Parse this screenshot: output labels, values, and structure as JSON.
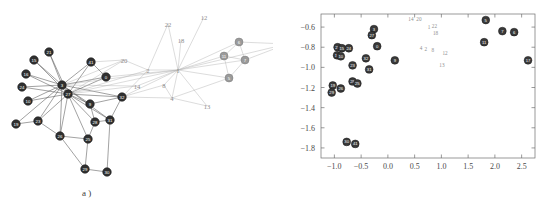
{
  "figure": {
    "panels": [
      {
        "id": "a",
        "caption": "a )"
      },
      {
        "id": "b",
        "caption": "b )"
      }
    ]
  },
  "chart_data": [
    {
      "type": "scatter",
      "panel": "a",
      "title": "",
      "xlabel": "",
      "ylabel": "",
      "grid": false,
      "legend": "none",
      "description": "Force-directed network graph of 22 labelled nodes with straight-line edges. Dark filled nodes form a dense left-hand cluster around two overlapping hubs; light grey numeric labels mark peripheral nodes.",
      "nodes": [
        {
          "id": "21",
          "x": 49,
          "y": 52,
          "kind": "dark"
        },
        {
          "id": "15",
          "x": 34,
          "y": 60,
          "kind": "dark"
        },
        {
          "id": "16",
          "x": 26,
          "y": 74,
          "kind": "dark"
        },
        {
          "id": "24",
          "x": 22,
          "y": 87,
          "kind": "dark"
        },
        {
          "id": "10",
          "x": 28,
          "y": 101,
          "kind": "dark"
        },
        {
          "id": "19",
          "x": 16,
          "y": 124,
          "kind": "dark"
        },
        {
          "id": "23",
          "x": 38,
          "y": 121,
          "kind": "dark"
        },
        {
          "id": "3",
          "x": 62,
          "y": 85,
          "kind": "dark"
        },
        {
          "id": "27",
          "x": 68,
          "y": 94,
          "kind": "dark"
        },
        {
          "id": "26",
          "x": 60,
          "y": 136,
          "kind": "dark"
        },
        {
          "id": "25",
          "x": 88,
          "y": 139,
          "kind": "dark"
        },
        {
          "id": "28",
          "x": 95,
          "y": 122,
          "kind": "dark"
        },
        {
          "id": "9",
          "x": 90,
          "y": 104,
          "kind": "dark"
        },
        {
          "id": "29",
          "x": 85,
          "y": 169,
          "kind": "dark"
        },
        {
          "id": "30",
          "x": 107,
          "y": 172,
          "kind": "dark"
        },
        {
          "id": "31",
          "x": 110,
          "y": 120,
          "kind": "dark"
        },
        {
          "id": "32",
          "x": 122,
          "y": 97,
          "kind": "dark"
        },
        {
          "id": "0",
          "x": 106,
          "y": 77,
          "kind": "dark"
        },
        {
          "id": "41",
          "x": 91,
          "y": 62,
          "kind": "dark"
        },
        {
          "id": "6",
          "x": 239,
          "y": 42,
          "kind": "grey"
        },
        {
          "id": "11",
          "x": 224,
          "y": 56,
          "kind": "grey"
        },
        {
          "id": "7",
          "x": 245,
          "y": 60,
          "kind": "grey"
        },
        {
          "id": "5",
          "x": 229,
          "y": 78,
          "kind": "grey"
        }
      ],
      "free_labels": [
        {
          "text": "22",
          "x": 168,
          "y": 24
        },
        {
          "text": "12",
          "x": 204,
          "y": 17
        },
        {
          "text": "18",
          "x": 181,
          "y": 40
        },
        {
          "text": "20",
          "x": 124,
          "y": 60
        },
        {
          "text": "2",
          "x": 148,
          "y": 70
        },
        {
          "text": "1",
          "x": 178,
          "y": 70
        },
        {
          "text": "14",
          "x": 137,
          "y": 86
        },
        {
          "text": "8",
          "x": 164,
          "y": 85
        },
        {
          "text": "4",
          "x": 172,
          "y": 98
        },
        {
          "text": "13",
          "x": 207,
          "y": 106
        },
        {
          "text": "17",
          "x": 287,
          "y": 44
        }
      ],
      "edges": [
        [
          "3",
          "21"
        ],
        [
          "3",
          "15"
        ],
        [
          "3",
          "16"
        ],
        [
          "3",
          "24"
        ],
        [
          "3",
          "10"
        ],
        [
          "3",
          "23"
        ],
        [
          "3",
          "19"
        ],
        [
          "3",
          "27"
        ],
        [
          "3",
          "0"
        ],
        [
          "3",
          "41"
        ],
        [
          "3",
          "9"
        ],
        [
          "3",
          "31"
        ],
        [
          "3",
          "32"
        ],
        [
          "3",
          "26"
        ],
        [
          "27",
          "21"
        ],
        [
          "27",
          "15"
        ],
        [
          "27",
          "16"
        ],
        [
          "27",
          "24"
        ],
        [
          "27",
          "10"
        ],
        [
          "27",
          "23"
        ],
        [
          "27",
          "0"
        ],
        [
          "27",
          "41"
        ],
        [
          "27",
          "9"
        ],
        [
          "27",
          "28"
        ],
        [
          "27",
          "25"
        ],
        [
          "27",
          "31"
        ],
        [
          "27",
          "32"
        ],
        [
          "27",
          "26"
        ],
        [
          "27",
          "L20"
        ],
        [
          "27",
          "L2"
        ],
        [
          "27",
          "L1"
        ],
        [
          "27",
          "L14"
        ],
        [
          "3",
          "L1"
        ],
        [
          "3",
          "L14"
        ],
        [
          "3",
          "L20"
        ],
        [
          "19",
          "23"
        ],
        [
          "23",
          "26"
        ],
        [
          "26",
          "25"
        ],
        [
          "26",
          "29"
        ],
        [
          "25",
          "28"
        ],
        [
          "25",
          "29"
        ],
        [
          "28",
          "9"
        ],
        [
          "28",
          "31"
        ],
        [
          "9",
          "32"
        ],
        [
          "31",
          "30"
        ],
        [
          "31",
          "32"
        ],
        [
          "29",
          "30"
        ],
        [
          "41",
          "0"
        ],
        [
          "41",
          "L20"
        ],
        [
          "0",
          "L1"
        ],
        [
          "32",
          "L8"
        ],
        [
          "32",
          "L4"
        ],
        [
          "32",
          "L1"
        ],
        [
          "L20",
          "L2"
        ],
        [
          "L2",
          "L1"
        ],
        [
          "L2",
          "L22"
        ],
        [
          "L22",
          "L1"
        ],
        [
          "L18",
          "L1"
        ],
        [
          "L12",
          "L1"
        ],
        [
          "L1",
          "L8"
        ],
        [
          "L1",
          "L4"
        ],
        [
          "L1",
          "L13"
        ],
        [
          "L1",
          "6"
        ],
        [
          "L1",
          "11"
        ],
        [
          "L1",
          "7"
        ],
        [
          "L1",
          "5"
        ],
        [
          "L1",
          "17"
        ],
        [
          "L4",
          "L13"
        ],
        [
          "L4",
          "5"
        ],
        [
          "L8",
          "L4"
        ],
        [
          "6",
          "11"
        ],
        [
          "6",
          "7"
        ],
        [
          "11",
          "7"
        ],
        [
          "11",
          "5"
        ],
        [
          "7",
          "5"
        ],
        [
          "6",
          "17"
        ],
        [
          "7",
          "17"
        ],
        [
          "L14",
          "L1"
        ],
        [
          "L2",
          "32"
        ]
      ]
    },
    {
      "type": "scatter",
      "panel": "b",
      "title": "",
      "xlabel": "",
      "ylabel": "",
      "grid": false,
      "legend": "none",
      "xlim": [
        -1.25,
        2.75
      ],
      "ylim": [
        -1.9,
        -0.47
      ],
      "xticks": [
        "-1.0",
        "-0.5",
        "0.0",
        "0.5",
        "1.0",
        "1.5",
        "2.0",
        "2.5"
      ],
      "xtickvals": [
        -1.0,
        -0.5,
        0.0,
        0.5,
        1.0,
        1.5,
        2.0,
        2.5
      ],
      "yticks": [
        "-0.6",
        "-0.8",
        "-1.0",
        "-1.2",
        "-1.4",
        "-1.6",
        "-1.8"
      ],
      "ytickvals": [
        -0.6,
        -0.8,
        -1.0,
        -1.2,
        -1.4,
        -1.6,
        -1.8
      ],
      "points": [
        {
          "id": "3",
          "x": -0.26,
          "y": -0.62,
          "kind": "dark"
        },
        {
          "id": "27",
          "x": -0.3,
          "y": -0.68,
          "kind": "dark"
        },
        {
          "id": "0",
          "x": -0.2,
          "y": -0.79,
          "kind": "dark"
        },
        {
          "id": "21",
          "x": -0.94,
          "y": -0.8,
          "kind": "dark"
        },
        {
          "id": "15",
          "x": -0.86,
          "y": -0.81,
          "kind": "dark"
        },
        {
          "id": "24",
          "x": -0.73,
          "y": -0.81,
          "kind": "dark"
        },
        {
          "id": "16",
          "x": -0.95,
          "y": -0.88,
          "kind": "dark"
        },
        {
          "id": "10",
          "x": -0.88,
          "y": -0.89,
          "kind": "dark"
        },
        {
          "id": "32",
          "x": -0.41,
          "y": -0.91,
          "kind": "dark"
        },
        {
          "id": "9",
          "x": 0.13,
          "y": -0.93,
          "kind": "dark"
        },
        {
          "id": "23",
          "x": -0.66,
          "y": -0.98,
          "kind": "dark"
        },
        {
          "id": "31",
          "x": -0.35,
          "y": -1.02,
          "kind": "dark"
        },
        {
          "id": "28",
          "x": -0.66,
          "y": -1.14,
          "kind": "dark"
        },
        {
          "id": "25",
          "x": -0.57,
          "y": -1.16,
          "kind": "dark"
        },
        {
          "id": "19",
          "x": -1.03,
          "y": -1.18,
          "kind": "dark"
        },
        {
          "id": "26",
          "x": -0.88,
          "y": -1.21,
          "kind": "dark"
        },
        {
          "id": "29",
          "x": -1.05,
          "y": -1.25,
          "kind": "dark"
        },
        {
          "id": "30",
          "x": -0.77,
          "y": -1.74,
          "kind": "dark"
        },
        {
          "id": "41",
          "x": -0.61,
          "y": -1.76,
          "kind": "dark"
        },
        {
          "id": "5",
          "x": 1.83,
          "y": -0.53,
          "kind": "dark"
        },
        {
          "id": "7",
          "x": 2.14,
          "y": -0.64,
          "kind": "dark"
        },
        {
          "id": "6",
          "x": 2.36,
          "y": -0.65,
          "kind": "dark"
        },
        {
          "id": "11",
          "x": 1.8,
          "y": -0.75,
          "kind": "dark"
        },
        {
          "id": "17",
          "x": 2.62,
          "y": -0.93,
          "kind": "dark"
        }
      ],
      "text_points": [
        {
          "text": "14",
          "x": 0.43,
          "y": -0.52
        },
        {
          "text": "20",
          "x": 0.58,
          "y": -0.52
        },
        {
          "text": "1",
          "x": 0.77,
          "y": -0.6
        },
        {
          "text": "22",
          "x": 0.87,
          "y": -0.59
        },
        {
          "text": "18",
          "x": 0.89,
          "y": -0.66
        },
        {
          "text": "4",
          "x": 0.62,
          "y": -0.81
        },
        {
          "text": "2",
          "x": 0.71,
          "y": -0.82
        },
        {
          "text": "8",
          "x": 0.84,
          "y": -0.83
        },
        {
          "text": "12",
          "x": 1.07,
          "y": -0.86
        },
        {
          "text": "13",
          "x": 1.01,
          "y": -0.98
        }
      ]
    }
  ]
}
